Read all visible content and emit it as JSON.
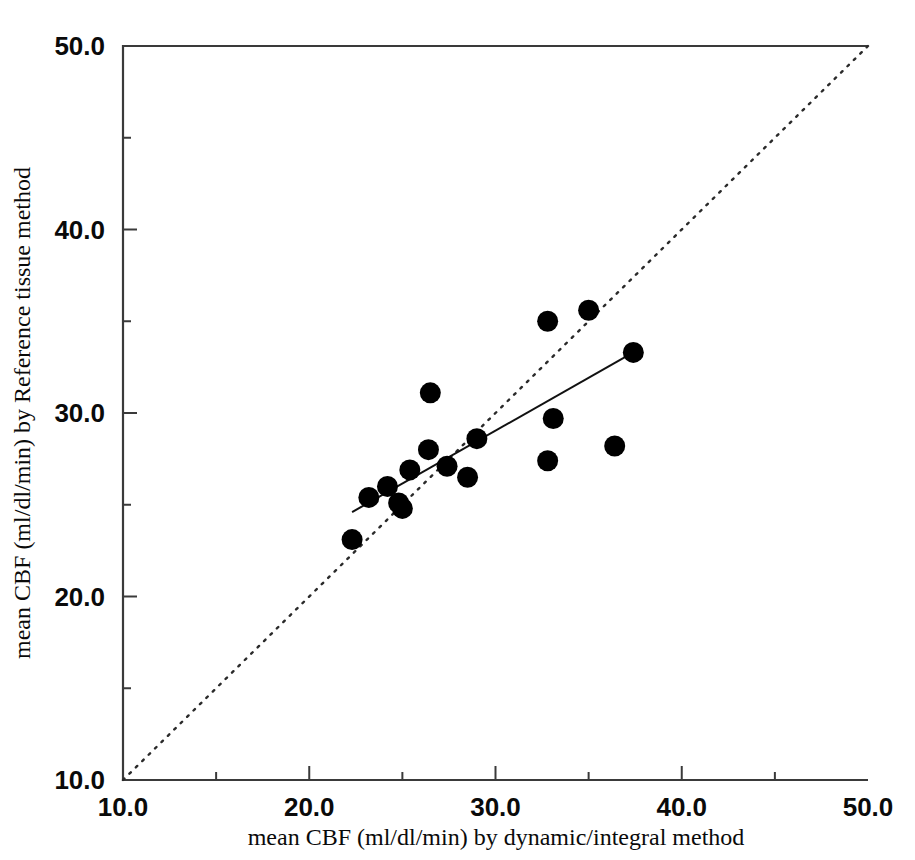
{
  "chart_data": {
    "type": "scatter",
    "title": "",
    "xlabel": "mean CBF (ml/dl/min) by dynamic/integral method",
    "ylabel": "mean CBF (ml/dl/min) by Reference tissue method",
    "xlim": [
      10.0,
      50.0
    ],
    "ylim": [
      10.0,
      50.0
    ],
    "xticks": [
      10.0,
      20.0,
      30.0,
      40.0,
      50.0
    ],
    "yticks": [
      10.0,
      20.0,
      30.0,
      40.0,
      50.0
    ],
    "xtick_labels": [
      "10.0",
      "20.0",
      "30.0",
      "40.0",
      "50.0"
    ],
    "ytick_labels": [
      "10.0",
      "20.0",
      "30.0",
      "40.0",
      "50.0"
    ],
    "xminor_ticks": [
      15.0,
      25.0,
      35.0,
      45.0
    ],
    "yminor_ticks": [
      15.0,
      25.0,
      35.0,
      45.0
    ],
    "grid": false,
    "legend": null,
    "marker": "filled-circle",
    "marker_color": "#000000",
    "points": [
      {
        "x": 22.3,
        "y": 23.1
      },
      {
        "x": 23.2,
        "y": 25.4
      },
      {
        "x": 24.2,
        "y": 26.0
      },
      {
        "x": 24.8,
        "y": 25.1
      },
      {
        "x": 25.0,
        "y": 24.8
      },
      {
        "x": 25.4,
        "y": 26.9
      },
      {
        "x": 26.4,
        "y": 28.0
      },
      {
        "x": 26.5,
        "y": 31.1
      },
      {
        "x": 27.4,
        "y": 27.1
      },
      {
        "x": 28.5,
        "y": 26.5
      },
      {
        "x": 29.0,
        "y": 28.6
      },
      {
        "x": 32.8,
        "y": 35.0
      },
      {
        "x": 32.8,
        "y": 27.4
      },
      {
        "x": 33.1,
        "y": 29.7
      },
      {
        "x": 35.0,
        "y": 35.6
      },
      {
        "x": 36.4,
        "y": 28.2
      },
      {
        "x": 37.4,
        "y": 33.3
      }
    ],
    "regression_line": {
      "style": "solid",
      "x0": 22.3,
      "y0": 24.6,
      "x1": 37.4,
      "y1": 33.3
    },
    "identity_line": {
      "style": "dotted",
      "label": "line of identity",
      "x0": 10.0,
      "y0": 10.0,
      "x1": 50.0,
      "y1": 50.0
    }
  },
  "figure": {
    "background": "#ffffff",
    "axis_color": "#3a3a3a"
  }
}
